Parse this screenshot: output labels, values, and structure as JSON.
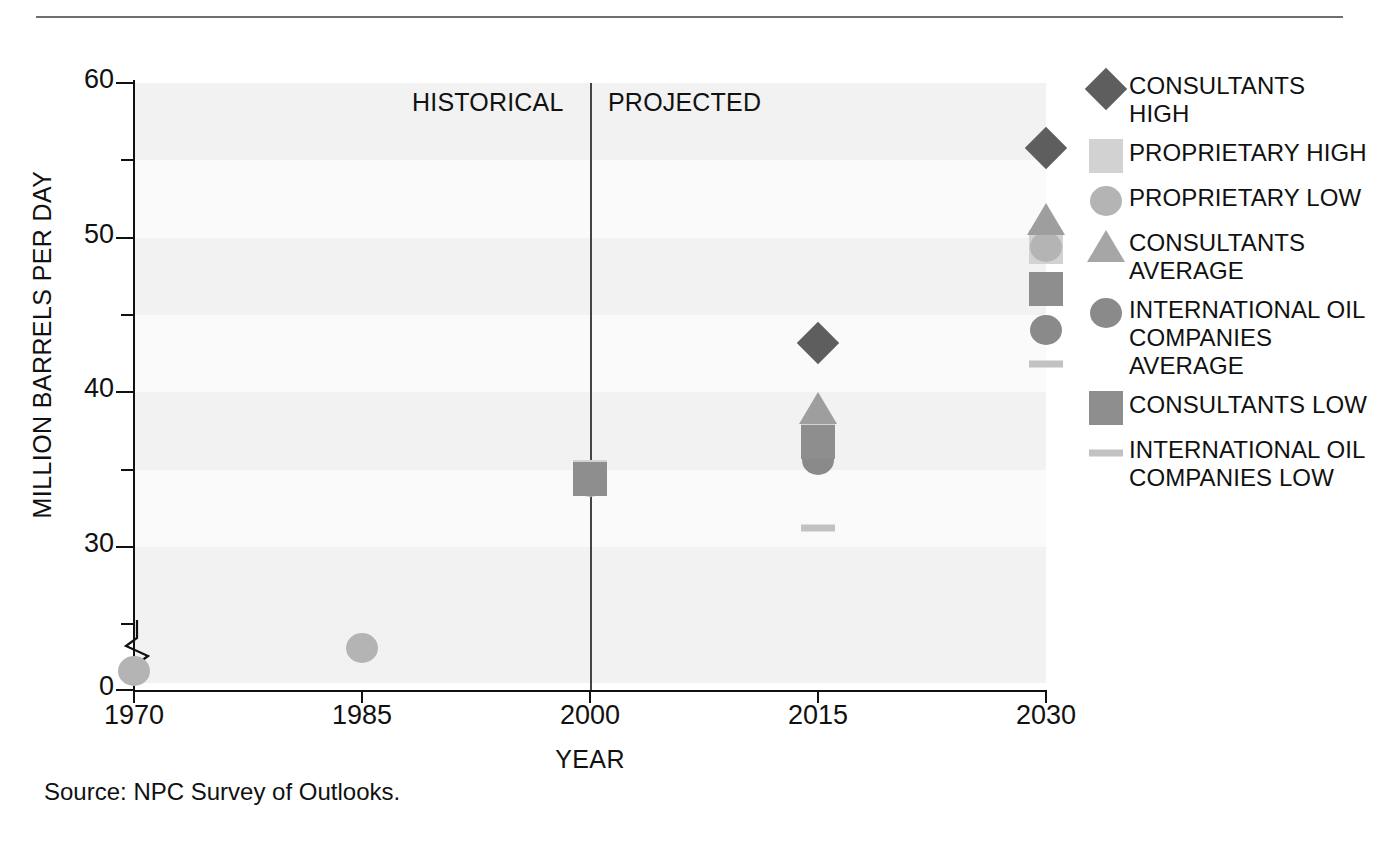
{
  "figure": {
    "source_note": "Source:  NPC Survey of Outlooks.",
    "era_labels": {
      "historical": "HISTORICAL",
      "projected": "PROJECTED"
    }
  },
  "chart_data": {
    "type": "scatter",
    "title": "",
    "xlabel": "YEAR",
    "ylabel": "MILLION BARRELS PER DAY",
    "xlim": [
      1970,
      2030
    ],
    "ylim": [
      0,
      60
    ],
    "ytick_labels": [
      "60",
      "50",
      "40",
      "30",
      "0"
    ],
    "ytick_values": [
      60,
      50,
      40,
      30,
      0
    ],
    "yminor_values": [
      55,
      45,
      35,
      25
    ],
    "axis_break": true,
    "xtick_labels": [
      "1970",
      "1985",
      "2000",
      "2015",
      "2030"
    ],
    "xtick_values": [
      1970,
      1985,
      2000,
      2015,
      2030
    ],
    "grid": "horizontal-bands",
    "legend_position": "right",
    "divider_year": 2000,
    "series": [
      {
        "name": "CONSULTANTS HIGH",
        "marker": "diamond",
        "color": "#5e5e5e",
        "points": [
          {
            "x": 2015,
            "y": 43.2
          },
          {
            "x": 2030,
            "y": 55.8
          }
        ]
      },
      {
        "name": "PROPRIETARY HIGH",
        "marker": "square",
        "color": "#d2d2d2",
        "points": [
          {
            "x": 2000,
            "y": 34.5
          },
          {
            "x": 2015,
            "y": 37.0
          },
          {
            "x": 2030,
            "y": 49.4
          }
        ]
      },
      {
        "name": "PROPRIETARY LOW",
        "marker": "circle",
        "color": "#b4b4b4",
        "points": [
          {
            "x": 1970,
            "y": 22.0
          },
          {
            "x": 1985,
            "y": 23.5
          },
          {
            "x": 2000,
            "y": 34.2
          },
          {
            "x": 2030,
            "y": 49.4
          }
        ]
      },
      {
        "name": "CONSULTANTS AVERAGE",
        "marker": "triangle",
        "color": "#9e9e9e",
        "points": [
          {
            "x": 2015,
            "y": 39.0
          },
          {
            "x": 2030,
            "y": 51.2
          }
        ]
      },
      {
        "name": "INTERNATIONAL OIL COMPANIES AVERAGE",
        "marker": "circle",
        "color": "#8a8a8a",
        "points": [
          {
            "x": 2015,
            "y": 35.6
          },
          {
            "x": 2030,
            "y": 44.0
          }
        ]
      },
      {
        "name": "CONSULTANTS LOW",
        "marker": "square",
        "color": "#8e8e8e",
        "points": [
          {
            "x": 2000,
            "y": 34.4
          },
          {
            "x": 2015,
            "y": 36.8
          },
          {
            "x": 2030,
            "y": 46.7
          }
        ]
      },
      {
        "name": "INTERNATIONAL OIL COMPANIES LOW",
        "marker": "dash",
        "color": "#c2c2c2",
        "points": [
          {
            "x": 2015,
            "y": 31.2
          },
          {
            "x": 2030,
            "y": 41.8
          }
        ]
      }
    ]
  },
  "legend": {
    "items": [
      {
        "label": "CONSULTANTS HIGH",
        "marker": "diamond",
        "color": "#5e5e5e"
      },
      {
        "label": "PROPRIETARY HIGH",
        "marker": "square",
        "color": "#d2d2d2"
      },
      {
        "label": "PROPRIETARY LOW",
        "marker": "circle",
        "color": "#b4b4b4"
      },
      {
        "label": "CONSULTANTS AVERAGE",
        "marker": "triangle",
        "color": "#a6a6a6"
      },
      {
        "label": "INTERNATIONAL OIL COMPANIES AVERAGE",
        "marker": "circle",
        "color": "#8a8a8a"
      },
      {
        "label": "CONSULTANTS LOW",
        "marker": "square",
        "color": "#8e8e8e"
      },
      {
        "label": "INTERNATIONAL OIL COMPANIES LOW",
        "marker": "dash",
        "color": "#c2c2c2"
      }
    ]
  }
}
